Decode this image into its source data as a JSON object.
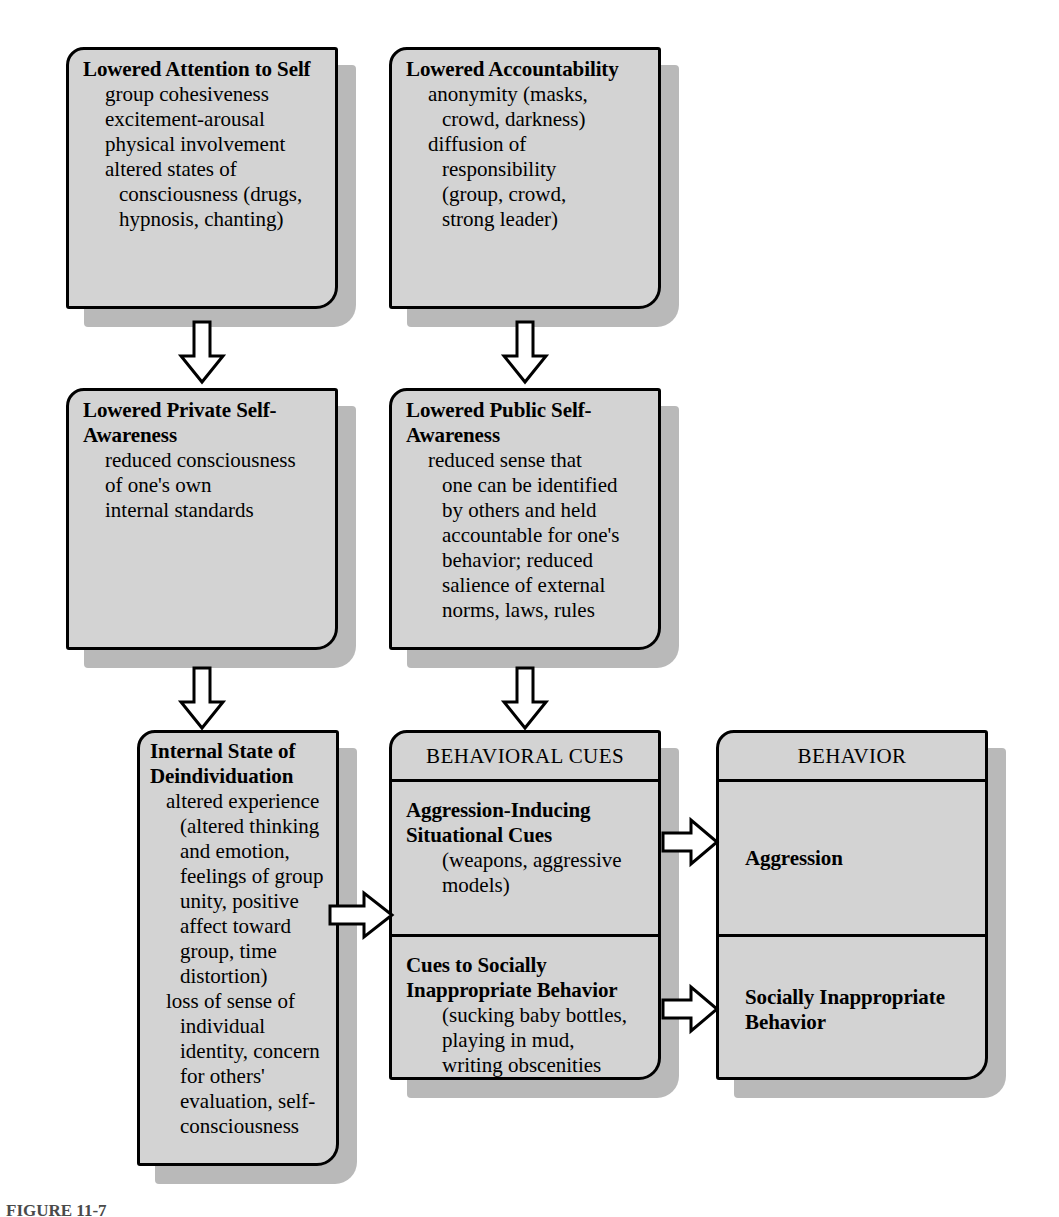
{
  "figure": {
    "type": "flowchart",
    "caption": "FIGURE 11-7",
    "colors": {
      "box_fill": "#d3d3d3",
      "box_border": "#000000",
      "shadow": "#b9b9b9",
      "page_background": "#ffffff",
      "arrow_fill": "#ffffff",
      "arrow_stroke": "#000000"
    }
  },
  "nodes": {
    "lowered_attention": {
      "title": "Lowered Attention to Self",
      "items": [
        "group cohesiveness",
        "excitement-arousal",
        "physical involvement",
        "altered states of",
        "consciousness (drugs,",
        "hypnosis, chanting)"
      ]
    },
    "lowered_accountability": {
      "title": "Lowered Accountability",
      "items": [
        "anonymity (masks,",
        "crowd, darkness)",
        "diffusion of",
        "responsibility",
        "(group, crowd,",
        "strong leader)"
      ]
    },
    "lowered_private": {
      "title": "Lowered Private Self-Awareness",
      "items": [
        "reduced consciousness",
        "of one's own",
        "internal standards"
      ]
    },
    "lowered_public": {
      "title": "Lowered Public Self-Awareness",
      "items": [
        "reduced sense that",
        "one can be identified",
        "by others and held",
        "accountable for one's",
        "behavior; reduced",
        "salience of external",
        "norms, laws, rules"
      ]
    },
    "internal_state": {
      "title": "Internal State of Deindividuation",
      "items": [
        "altered experience",
        "(altered thinking",
        "and emotion,",
        "feelings of group",
        "unity, positive",
        "affect toward",
        "group, time",
        "distortion)",
        "loss of sense of",
        "individual",
        "identity, concern",
        "for others'",
        "evaluation, self-",
        "consciousness"
      ]
    },
    "behavioral_cues": {
      "banner": "BEHAVIORAL CUES",
      "cells": [
        {
          "title": "Aggression-Inducing Situational Cues",
          "items": [
            "(weapons, aggressive",
            "models)"
          ]
        },
        {
          "title": "Cues to Socially Inappropriate Behavior",
          "items": [
            "(sucking baby bottles,",
            "playing in mud,",
            "writing obscenities"
          ]
        }
      ]
    },
    "behavior": {
      "banner": "BEHAVIOR",
      "cells": [
        {
          "title": "Aggression",
          "items": []
        },
        {
          "title": "Socially Inappropriate Behavior",
          "items": []
        }
      ]
    }
  },
  "arrows": [
    {
      "name": "attention-to-private",
      "direction": "down"
    },
    {
      "name": "accountability-to-public",
      "direction": "down"
    },
    {
      "name": "private-to-internal-state",
      "direction": "down"
    },
    {
      "name": "public-to-behavioral-cues",
      "direction": "down"
    },
    {
      "name": "internal-state-to-behavioral-cues",
      "direction": "right"
    },
    {
      "name": "aggression-cues-to-aggression",
      "direction": "right"
    },
    {
      "name": "social-cues-to-social-behavior",
      "direction": "right"
    }
  ]
}
